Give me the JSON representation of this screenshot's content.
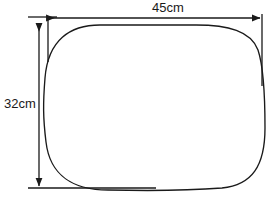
{
  "figure": {
    "type": "geometry-diagram",
    "background_color": "#ffffff",
    "stroke_color": "#1a1a1a",
    "text_color": "#1a1a1a"
  },
  "shape": {
    "name": "rounded-rectangle",
    "left": 45,
    "top": 25,
    "right": 265,
    "bottom": 190,
    "corner_radius": 55,
    "stroke_width": 1.3
  },
  "dimensions": {
    "width": {
      "label": "45cm",
      "value": 45,
      "unit": "cm",
      "orientation": "horizontal",
      "line_y": 18,
      "start_x": 45,
      "end_x": 262,
      "label_x": 168,
      "label_y": 12
    },
    "height": {
      "label": "32cm",
      "value": 32,
      "unit": "cm",
      "orientation": "vertical",
      "line_x": 39,
      "start_y": 22,
      "end_y": 188,
      "label_x": 20,
      "label_y": 108
    }
  },
  "extension_lines": [
    {
      "name": "top-left-horizontal",
      "x1": 28,
      "y1": 17,
      "x2": 57,
      "y2": 17
    },
    {
      "name": "left-vertical",
      "x1": 48,
      "y1": 17,
      "x2": 48,
      "y2": 60
    },
    {
      "name": "right-vertical",
      "x1": 262,
      "y1": 14,
      "x2": 262,
      "y2": 86
    },
    {
      "name": "bottom-horizontal",
      "x1": 28,
      "y1": 188,
      "x2": 156,
      "y2": 188
    }
  ]
}
